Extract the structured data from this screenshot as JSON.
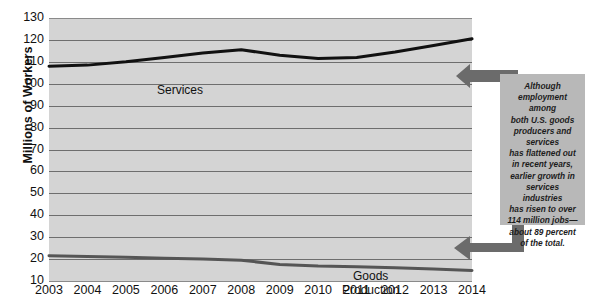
{
  "chart_data": {
    "type": "line",
    "title": "",
    "xlabel": "",
    "ylabel": "Millions of Workers",
    "ylim": [
      10,
      130
    ],
    "y_ticks": [
      130,
      120,
      110,
      100,
      90,
      80,
      70,
      60,
      50,
      40,
      30,
      20,
      10
    ],
    "grid": true,
    "legend": "inline-labels",
    "categories": [
      "2003",
      "2004",
      "2005",
      "2006",
      "2007",
      "2008",
      "2009",
      "2010",
      "2011",
      "2012",
      "2013",
      "2014"
    ],
    "series": [
      {
        "name": "Services",
        "label": "Services",
        "color": "#111111",
        "values": [
          108,
          108.5,
          110,
          112,
          114,
          115.5,
          113,
          111.5,
          112,
          114.5,
          117.5,
          120.5
        ]
      },
      {
        "name": "Goods Production",
        "label": "Goods\nProduction",
        "color": "#555555",
        "values": [
          21.5,
          21.2,
          20.8,
          20.4,
          20,
          19.5,
          17.5,
          16.8,
          16.5,
          16,
          15.5,
          14.8
        ]
      }
    ],
    "annotations": [
      {
        "name": "callout-note",
        "lines": [
          "Although",
          "employment among",
          "both U.S. goods",
          "producers and",
          "services",
          "has flattened out",
          "in recent years,",
          "earlier growth in",
          "services industries",
          "has risen to over",
          "114 million jobs—",
          "about 89 percent",
          "of the total."
        ]
      }
    ]
  },
  "axis": {
    "y_title": "Millions of Workers"
  },
  "colors": {
    "plot_background": "#d4d4d4",
    "gridline": "#6e6e6e",
    "callout_background": "#b8b8b8",
    "arrow": "#6b6b6b",
    "services_line": "#111111",
    "goods_line": "#555555"
  }
}
